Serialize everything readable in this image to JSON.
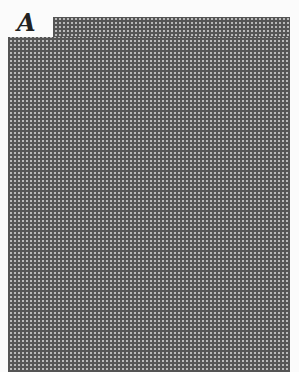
{
  "figure": {
    "panel_label": "A",
    "pattern": {
      "type": "grid-texture",
      "line_color": "#555555",
      "fill_color": "#b9b9b9",
      "background": "#fbfbfb"
    }
  }
}
